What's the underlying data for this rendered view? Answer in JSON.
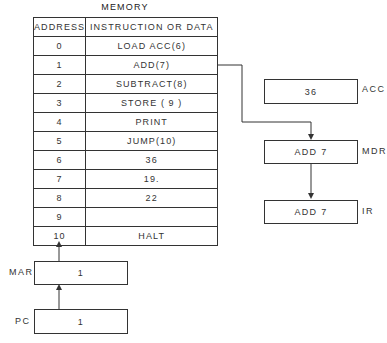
{
  "memory": {
    "title": "MEMORY",
    "headers": {
      "address": "ADDRESS",
      "content": "INSTRUCTION OR DATA"
    },
    "rows": [
      {
        "address": "0",
        "content": "LOAD ACC(6)"
      },
      {
        "address": "1",
        "content": "ADD(7)"
      },
      {
        "address": "2",
        "content": "SUBTRACT(8)"
      },
      {
        "address": "3",
        "content": "STORE ( 9 )"
      },
      {
        "address": "4",
        "content": "PRINT"
      },
      {
        "address": "5",
        "content": "JUMP(10)"
      },
      {
        "address": "6",
        "content": "36"
      },
      {
        "address": "7",
        "content": "19."
      },
      {
        "address": "8",
        "content": "22"
      },
      {
        "address": "9",
        "content": ""
      },
      {
        "address": "10",
        "content": "HALT"
      }
    ]
  },
  "registers": {
    "acc": {
      "label": "ACC",
      "value": "36"
    },
    "mdr": {
      "label": "MDR",
      "value": "ADD 7"
    },
    "ir": {
      "label": "IR",
      "value": "ADD 7"
    },
    "mar": {
      "label": "MAR",
      "value": "1"
    },
    "pc": {
      "label": "PC",
      "value": "1"
    }
  },
  "colors": {
    "line": "#333333",
    "background": "#ffffff"
  }
}
